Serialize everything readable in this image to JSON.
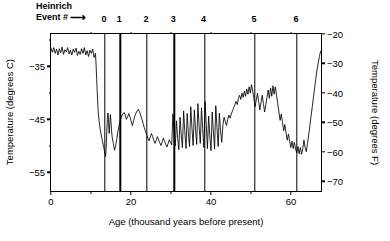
{
  "header": {
    "line1": "Heinrich",
    "line2": "Event #",
    "arrow": "⟶",
    "arrow_icon_name": "right-arrow-icon"
  },
  "heinrich_events": [
    {
      "label": "0",
      "age_ka": 13.5
    },
    {
      "label": "1",
      "age_ka": 17.3
    },
    {
      "label": "2",
      "age_ka": 24.0
    },
    {
      "label": "3",
      "age_ka": 30.8
    },
    {
      "label": "4",
      "age_ka": 38.4
    },
    {
      "label": "5",
      "age_ka": 51.0
    },
    {
      "label": "6",
      "age_ka": 61.5
    }
  ],
  "axes": {
    "x": {
      "title": "Age (thousand years before present)",
      "ticks": [
        0,
        20,
        40,
        60
      ],
      "tick_labels": [
        "0",
        "20",
        "40",
        "60"
      ],
      "minor_ticks": [
        10,
        30,
        50
      ],
      "range": [
        0,
        68
      ]
    },
    "y_left": {
      "title": "Temperature (degrees C)",
      "ticks": [
        -35,
        -45,
        -55
      ],
      "tick_labels": [
        "−35",
        "−45",
        "−55"
      ],
      "minor_ticks": [
        -30,
        -40,
        -50
      ],
      "range": [
        -58.9,
        -28.9
      ]
    },
    "y_right": {
      "title": "Temperature (degrees F)",
      "ticks": [
        -20,
        -30,
        -40,
        -50,
        -60,
        -70
      ],
      "tick_labels": [
        "−20",
        "−30",
        "−40",
        "−50",
        "−60",
        "−70"
      ],
      "range": [
        -74,
        -20
      ]
    }
  },
  "chart_data": {
    "type": "line",
    "title": "",
    "subtitle": "",
    "xlabel": "Age (thousand years before present)",
    "ylabel": "Temperature (degrees C)",
    "ylabel_secondary": "Temperature (degrees F)",
    "xlim": [
      0,
      68
    ],
    "ylim": [
      -58.9,
      -28.9
    ],
    "ylim_secondary": [
      -74,
      -20
    ],
    "grid": false,
    "legend": false,
    "line_color": "#000000",
    "series_name": "GISP2 ice-core temperature",
    "annotations": [
      {
        "text": "0",
        "x": 13.5,
        "type": "vertical-line"
      },
      {
        "text": "1",
        "x": 17.3,
        "type": "vertical-line"
      },
      {
        "text": "2",
        "x": 24.0,
        "type": "vertical-line"
      },
      {
        "text": "3",
        "x": 30.8,
        "type": "vertical-line"
      },
      {
        "text": "4",
        "x": 38.4,
        "type": "vertical-line"
      },
      {
        "text": "5",
        "x": 51.0,
        "type": "vertical-line"
      },
      {
        "text": "6",
        "x": 61.5,
        "type": "vertical-line"
      }
    ],
    "x": [
      0.0,
      0.35,
      0.7,
      1.05,
      1.4,
      1.75,
      2.1,
      2.45,
      2.8,
      3.15,
      3.5,
      3.85,
      4.2,
      4.55,
      4.9,
      5.25,
      5.6,
      5.95,
      6.3,
      6.65,
      7.0,
      7.35,
      7.7,
      8.05,
      8.4,
      8.75,
      9.1,
      9.45,
      9.8,
      10.15,
      10.5,
      10.85,
      11.2,
      11.35,
      11.5,
      11.65,
      11.8,
      11.95,
      12.1,
      12.25,
      12.4,
      12.55,
      12.7,
      12.85,
      13.0,
      13.15,
      13.3,
      13.45,
      13.6,
      13.75,
      13.9,
      14.05,
      14.2,
      14.35,
      14.5,
      14.65,
      14.8,
      14.95,
      15.1,
      15.25,
      15.4,
      15.7,
      16.0,
      16.3,
      16.6,
      16.9,
      17.2,
      17.5,
      17.8,
      18.1,
      18.4,
      18.7,
      19.0,
      19.3,
      19.6,
      19.9,
      20.2,
      20.5,
      20.8,
      21.1,
      21.4,
      21.7,
      22.0,
      22.3,
      22.6,
      22.9,
      23.2,
      23.5,
      23.8,
      24.1,
      24.4,
      24.7,
      25.0,
      25.3,
      25.6,
      25.9,
      26.2,
      26.5,
      26.8,
      27.1,
      27.4,
      27.7,
      28.0,
      28.3,
      28.6,
      28.9,
      29.2,
      29.5,
      29.8,
      30.1,
      30.4,
      30.7,
      31.0,
      31.3,
      31.6,
      31.9,
      32.2,
      32.5,
      32.8,
      33.1,
      33.4,
      33.7,
      34.0,
      34.3,
      34.6,
      34.9,
      35.2,
      35.5,
      35.8,
      36.1,
      36.4,
      36.7,
      37.0,
      37.3,
      37.6,
      37.9,
      38.2,
      38.5,
      38.8,
      39.1,
      39.4,
      39.7,
      40.0,
      40.3,
      40.6,
      40.9,
      41.2,
      41.5,
      41.8,
      42.1,
      42.4,
      42.7,
      43.0,
      43.3,
      43.6,
      43.9,
      44.2,
      44.5,
      44.8,
      45.1,
      45.4,
      45.7,
      46.0,
      46.3,
      46.6,
      46.9,
      47.2,
      47.5,
      47.8,
      48.1,
      48.4,
      48.7,
      49.0,
      49.3,
      49.6,
      49.9,
      50.2,
      50.5,
      50.8,
      51.1,
      51.4,
      51.7,
      52.0,
      52.3,
      52.6,
      52.9,
      53.2,
      53.5,
      53.8,
      54.1,
      54.4,
      54.7,
      55.0,
      55.3,
      55.6,
      55.9,
      56.2,
      56.5,
      56.8,
      57.1,
      57.4,
      57.7,
      58.0,
      58.3,
      58.6,
      58.9,
      59.2,
      59.5,
      59.8,
      60.1,
      60.4,
      60.7,
      61.0,
      61.3,
      61.6,
      61.9,
      62.2,
      62.5,
      62.8,
      63.1,
      63.4,
      63.7,
      64.0,
      64.3,
      64.6,
      64.9,
      65.2,
      65.5,
      65.8,
      66.1,
      66.4,
      66.7,
      67.0,
      67.3,
      67.6,
      67.9
    ],
    "y": [
      -31.6,
      -32.4,
      -31.5,
      -32.6,
      -31.8,
      -32.9,
      -31.7,
      -32.5,
      -31.4,
      -32.8,
      -31.9,
      -32.3,
      -31.5,
      -32.7,
      -32.0,
      -32.9,
      -31.8,
      -32.4,
      -31.6,
      -33.0,
      -32.2,
      -32.8,
      -31.7,
      -32.6,
      -31.5,
      -32.9,
      -32.1,
      -33.2,
      -32.0,
      -32.6,
      -31.8,
      -33.4,
      -32.6,
      -34.8,
      -37.4,
      -40.2,
      -42.6,
      -44.3,
      -45.4,
      -46.3,
      -47.1,
      -47.8,
      -48.4,
      -49.0,
      -49.5,
      -50.1,
      -50.6,
      -51.2,
      -51.8,
      -52.3,
      -50.5,
      -47.6,
      -45.2,
      -44.0,
      -45.8,
      -47.9,
      -46.2,
      -44.3,
      -45.6,
      -47.4,
      -48.6,
      -49.8,
      -51.1,
      -50.2,
      -48.8,
      -47.4,
      -46.2,
      -45.3,
      -44.6,
      -44.2,
      -43.9,
      -44.4,
      -45.2,
      -44.7,
      -44.1,
      -44.8,
      -45.6,
      -46.4,
      -45.5,
      -44.6,
      -44.0,
      -43.6,
      -43.3,
      -43.8,
      -44.5,
      -45.2,
      -46.0,
      -46.8,
      -47.5,
      -48.2,
      -48.8,
      -49.3,
      -48.6,
      -47.9,
      -48.5,
      -49.2,
      -49.8,
      -49.2,
      -48.5,
      -49.1,
      -49.7,
      -50.2,
      -49.5,
      -48.8,
      -49.4,
      -50.0,
      -50.5,
      -49.8,
      -49.1,
      -49.6,
      -50.1,
      -44.2,
      -47.8,
      -50.3,
      -45.5,
      -48.9,
      -51.0,
      -44.8,
      -48.2,
      -50.6,
      -43.6,
      -47.5,
      -50.8,
      -44.1,
      -48.0,
      -50.4,
      -42.8,
      -46.9,
      -50.2,
      -43.4,
      -47.2,
      -50.0,
      -42.2,
      -46.5,
      -49.8,
      -43.0,
      -47.0,
      -50.6,
      -41.8,
      -46.2,
      -50.8,
      -44.6,
      -48.4,
      -51.2,
      -43.8,
      -47.6,
      -50.9,
      -42.6,
      -46.8,
      -50.4,
      -44.0,
      -47.4,
      -49.6,
      -46.2,
      -44.8,
      -45.6,
      -46.4,
      -45.2,
      -44.4,
      -45.0,
      -44.2,
      -43.6,
      -43.0,
      -42.4,
      -41.8,
      -42.4,
      -41.2,
      -40.6,
      -41.4,
      -40.2,
      -41.0,
      -39.8,
      -40.8,
      -39.4,
      -40.4,
      -39.0,
      -40.2,
      -38.6,
      -39.8,
      -41.2,
      -42.8,
      -41.5,
      -40.2,
      -41.8,
      -43.4,
      -42.0,
      -40.6,
      -42.2,
      -43.8,
      -42.4,
      -41.0,
      -39.6,
      -41.2,
      -39.2,
      -40.8,
      -38.8,
      -40.4,
      -39.0,
      -40.6,
      -42.2,
      -43.8,
      -45.4,
      -44.2,
      -45.8,
      -47.4,
      -46.2,
      -47.8,
      -49.2,
      -48.0,
      -49.4,
      -50.6,
      -49.4,
      -50.8,
      -49.6,
      -50.9,
      -51.6,
      -50.4,
      -51.8,
      -50.6,
      -51.9,
      -50.8,
      -49.2,
      -50.6,
      -51.4,
      -49.8,
      -48.2,
      -46.4,
      -44.6,
      -42.8,
      -41.0,
      -39.2,
      -37.4,
      -35.8,
      -34.4,
      -33.2,
      -32.2,
      -31.4
    ]
  }
}
